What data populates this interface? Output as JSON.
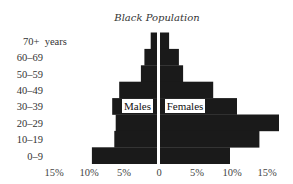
{
  "chart_data": {
    "type": "bar",
    "orientation": "horizontal-pyramid",
    "title": "Black Population",
    "categories": [
      "70+",
      "60–69",
      "50–59",
      "40–49",
      "30–39",
      "20–29",
      "10–19",
      "0–9"
    ],
    "category_labels": [
      "70+  years",
      "60–69",
      "50–59",
      "40–49",
      "30–39",
      "20–29",
      "10–19",
      "0–9"
    ],
    "series": [
      {
        "name": "Males",
        "side": "left",
        "values": [
          0.9,
          1.8,
          2.3,
          5.4,
          6.4,
          5.9,
          6.1,
          9.3
        ]
      },
      {
        "name": "Females",
        "side": "right",
        "values": [
          1.3,
          2.7,
          3.3,
          7.6,
          11.0,
          17.0,
          14.2,
          10.0
        ]
      }
    ],
    "x_ticks_left": [
      "15%",
      "10%",
      "5%"
    ],
    "x_ticks_right": [
      "0",
      "5%",
      "10%",
      "15%"
    ],
    "x_tick_values_left": [
      15,
      10,
      5
    ],
    "x_tick_values_right": [
      0,
      5,
      10,
      15
    ],
    "xlabel": "",
    "ylabel": "",
    "xlim": [
      0,
      17
    ],
    "grid": false,
    "legend": "inline-labels-center",
    "bar_color": "#1a1a1a"
  }
}
